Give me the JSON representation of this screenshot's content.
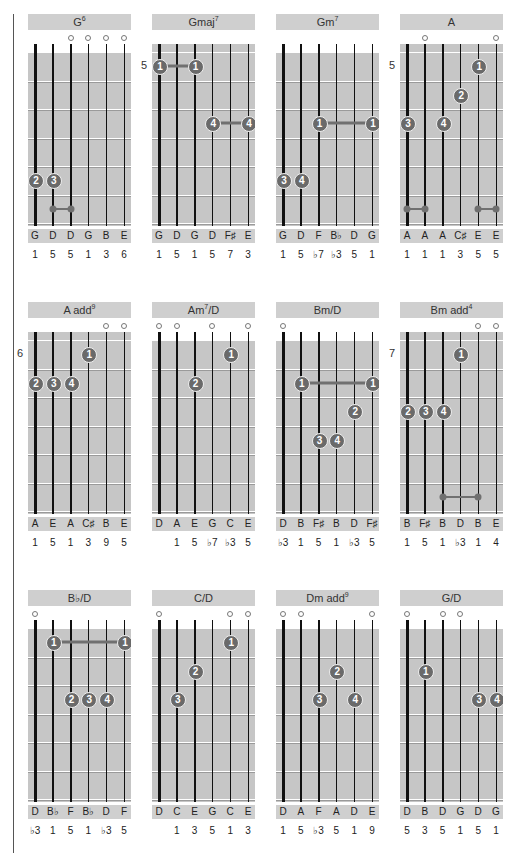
{
  "chart_data": {
    "type": "table",
    "charts": [
      {
        "name": "G",
        "sup": "6",
        "fret_number": null,
        "open": [
          3,
          4,
          5,
          6
        ],
        "fingers": [
          {
            "f": "2",
            "s": 1,
            "fr": 5
          },
          {
            "f": "3",
            "s": 2,
            "fr": 5
          }
        ],
        "barres": [],
        "muted_links": [
          {
            "from": 2,
            "to": 3,
            "fr": 6
          }
        ],
        "notes": [
          "G",
          "D",
          "D",
          "G",
          "B",
          "E"
        ],
        "intervals": [
          "1",
          "5",
          "5",
          "1",
          "3",
          "6"
        ]
      },
      {
        "name": "Gmaj",
        "sup": "7",
        "fret_number": "5",
        "open": [],
        "fingers": [
          {
            "f": "1",
            "s": 1,
            "fr": 1
          },
          {
            "f": "1",
            "s": 3,
            "fr": 1
          },
          {
            "f": "4",
            "s": 4,
            "fr": 3
          },
          {
            "f": "4",
            "s": 6,
            "fr": 3
          }
        ],
        "barres": [
          {
            "from": 1,
            "to": 3,
            "fr": 1
          },
          {
            "from": 4,
            "to": 6,
            "fr": 3
          }
        ],
        "muted_links": [],
        "notes": [
          "G",
          "D",
          "G",
          "D",
          "F♯",
          "E"
        ],
        "intervals": [
          "1",
          "5",
          "1",
          "5",
          "7",
          "3"
        ]
      },
      {
        "name": "Gm",
        "sup": "7",
        "fret_number": null,
        "open": [],
        "fingers": [
          {
            "f": "1",
            "s": 3,
            "fr": 3
          },
          {
            "f": "1",
            "s": 6,
            "fr": 3
          },
          {
            "f": "3",
            "s": 1,
            "fr": 5
          },
          {
            "f": "4",
            "s": 2,
            "fr": 5
          }
        ],
        "barres": [
          {
            "from": 3,
            "to": 6,
            "fr": 3
          }
        ],
        "muted_links": [],
        "notes": [
          "G",
          "D",
          "F",
          "B♭",
          "D",
          "G"
        ],
        "intervals": [
          "1",
          "5",
          "♭7",
          "♭3",
          "5",
          "1"
        ]
      },
      {
        "name": "A",
        "sup": "",
        "fret_number": "5",
        "open": [
          2,
          6
        ],
        "fingers": [
          {
            "f": "1",
            "s": 5,
            "fr": 1
          },
          {
            "f": "2",
            "s": 4,
            "fr": 2
          },
          {
            "f": "3",
            "s": 1,
            "fr": 3
          },
          {
            "f": "4",
            "s": 3,
            "fr": 3
          }
        ],
        "barres": [],
        "muted_links": [
          {
            "from": 1,
            "to": 2,
            "fr": 6
          },
          {
            "from": 5,
            "to": 6,
            "fr": 6
          }
        ],
        "notes": [
          "A",
          "A",
          "A",
          "C♯",
          "E",
          "E"
        ],
        "intervals": [
          "1",
          "1",
          "1",
          "3",
          "5",
          "5"
        ]
      },
      {
        "name": "A add",
        "sup": "9",
        "fret_number": "6",
        "open": [
          5,
          6
        ],
        "fingers": [
          {
            "f": "1",
            "s": 4,
            "fr": 1
          },
          {
            "f": "2",
            "s": 1,
            "fr": 2
          },
          {
            "f": "3",
            "s": 2,
            "fr": 2
          },
          {
            "f": "4",
            "s": 3,
            "fr": 2
          }
        ],
        "barres": [],
        "muted_links": [],
        "notes": [
          "A",
          "E",
          "A",
          "C♯",
          "B",
          "E"
        ],
        "intervals": [
          "1",
          "5",
          "1",
          "3",
          "9",
          "5"
        ]
      },
      {
        "name": "Am",
        "sup": "7",
        "suffix": "/D",
        "fret_number": null,
        "open": [
          1,
          2,
          4,
          6
        ],
        "fingers": [
          {
            "f": "1",
            "s": 5,
            "fr": 1
          },
          {
            "f": "2",
            "s": 3,
            "fr": 2
          }
        ],
        "barres": [],
        "muted_links": [],
        "notes": [
          "D",
          "A",
          "E",
          "G",
          "C",
          "E"
        ],
        "intervals": [
          "",
          "1",
          "5",
          "♭7",
          "♭3",
          "5"
        ]
      },
      {
        "name": "Bm/D",
        "sup": "",
        "fret_number": null,
        "open": [
          1
        ],
        "fingers": [
          {
            "f": "1",
            "s": 2,
            "fr": 2
          },
          {
            "f": "1",
            "s": 6,
            "fr": 2
          },
          {
            "f": "2",
            "s": 5,
            "fr": 3
          },
          {
            "f": "3",
            "s": 3,
            "fr": 4
          },
          {
            "f": "4",
            "s": 4,
            "fr": 4
          }
        ],
        "barres": [
          {
            "from": 2,
            "to": 6,
            "fr": 2
          }
        ],
        "muted_links": [],
        "notes": [
          "D",
          "B",
          "F♯",
          "B",
          "D",
          "F♯"
        ],
        "intervals": [
          "♭3",
          "1",
          "5",
          "1",
          "♭3",
          "5"
        ]
      },
      {
        "name": "Bm add",
        "sup": "4",
        "fret_number": "7",
        "open": [
          5,
          6
        ],
        "fingers": [
          {
            "f": "1",
            "s": 4,
            "fr": 1
          },
          {
            "f": "2",
            "s": 1,
            "fr": 3
          },
          {
            "f": "3",
            "s": 2,
            "fr": 3
          },
          {
            "f": "4",
            "s": 3,
            "fr": 3
          }
        ],
        "barres": [],
        "muted_links": [
          {
            "from": 3,
            "to": 5,
            "fr": 6
          }
        ],
        "notes": [
          "B",
          "F♯",
          "B",
          "D",
          "B",
          "E"
        ],
        "intervals": [
          "1",
          "5",
          "1",
          "♭3",
          "1",
          "4"
        ]
      },
      {
        "name": "B♭/D",
        "sup": "",
        "fret_number": null,
        "open": [
          1
        ],
        "fingers": [
          {
            "f": "1",
            "s": 2,
            "fr": 1
          },
          {
            "f": "1",
            "s": 6,
            "fr": 1
          },
          {
            "f": "2",
            "s": 3,
            "fr": 3
          },
          {
            "f": "3",
            "s": 4,
            "fr": 3
          },
          {
            "f": "4",
            "s": 5,
            "fr": 3
          }
        ],
        "barres": [
          {
            "from": 2,
            "to": 6,
            "fr": 1
          }
        ],
        "muted_links": [],
        "notes": [
          "D",
          "B♭",
          "F",
          "B♭",
          "D",
          "F"
        ],
        "intervals": [
          "♭3",
          "1",
          "5",
          "1",
          "♭3",
          "5"
        ]
      },
      {
        "name": "C/D",
        "sup": "",
        "fret_number": null,
        "open": [
          1,
          5,
          6
        ],
        "fingers": [
          {
            "f": "1",
            "s": 5,
            "fr": 1
          },
          {
            "f": "2",
            "s": 3,
            "fr": 2
          },
          {
            "f": "3",
            "s": 2,
            "fr": 3
          }
        ],
        "barres": [],
        "muted_links": [],
        "notes": [
          "D",
          "C",
          "E",
          "G",
          "C",
          "E"
        ],
        "intervals": [
          "",
          "1",
          "3",
          "5",
          "1",
          "3"
        ]
      },
      {
        "name": "Dm add",
        "sup": "9",
        "fret_number": null,
        "open": [
          1,
          2,
          6
        ],
        "fingers": [
          {
            "f": "2",
            "s": 4,
            "fr": 2
          },
          {
            "f": "3",
            "s": 3,
            "fr": 3
          },
          {
            "f": "4",
            "s": 5,
            "fr": 3
          }
        ],
        "barres": [],
        "muted_links": [],
        "notes": [
          "D",
          "A",
          "F",
          "A",
          "D",
          "E"
        ],
        "intervals": [
          "1",
          "5",
          "♭3",
          "5",
          "1",
          "9"
        ]
      },
      {
        "name": "G/D",
        "sup": "",
        "fret_number": null,
        "open": [
          1,
          3,
          4
        ],
        "fingers": [
          {
            "f": "1",
            "s": 2,
            "fr": 2
          },
          {
            "f": "3",
            "s": 5,
            "fr": 3
          },
          {
            "f": "4",
            "s": 6,
            "fr": 3
          }
        ],
        "barres": [],
        "muted_links": [],
        "notes": [
          "D",
          "B",
          "D",
          "G",
          "D",
          "G"
        ],
        "intervals": [
          "5",
          "3",
          "5",
          "1",
          "5",
          "1"
        ]
      }
    ]
  }
}
